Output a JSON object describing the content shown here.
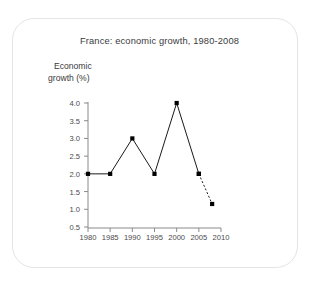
{
  "figure": {
    "card_border_color": "#e4e4e6",
    "background_color": "#ffffff"
  },
  "chart_data": {
    "type": "line",
    "title": "France: economic growth, 1980-2008",
    "xlabel": "Years",
    "ylabel": "Economic growth (%)",
    "ylabel_line1": "Economic",
    "ylabel_line2": "growth (%)",
    "x": [
      1980,
      1985,
      1990,
      1995,
      2000,
      2005,
      2008
    ],
    "values": [
      2.0,
      2.0,
      3.0,
      2.0,
      4.0,
      2.0,
      1.15
    ],
    "series": [
      {
        "name": "Economic growth (%)",
        "x": [
          1980,
          1985,
          1990,
          1995,
          2000,
          2005
        ],
        "values": [
          2.0,
          2.0,
          3.0,
          2.0,
          4.0,
          2.0
        ],
        "style": "solid",
        "marker": "square",
        "color": "#000000"
      },
      {
        "name": "Forecast",
        "x": [
          2005,
          2008
        ],
        "values": [
          2.0,
          1.15
        ],
        "style": "dashed",
        "marker": "square",
        "color": "#000000"
      }
    ],
    "xlim": [
      1980,
      2010
    ],
    "ylim": [
      0.5,
      4.0
    ],
    "xticks": [
      1980,
      1985,
      1990,
      1995,
      2000,
      2005,
      2010
    ],
    "xtick_labels": [
      "1980",
      "1985",
      "1990",
      "1995",
      "2000",
      "2005",
      "2010"
    ],
    "yticks": [
      4.0,
      3.5,
      3.0,
      2.5,
      2.0,
      1.5,
      1.0,
      0.5
    ],
    "ytick_labels": [
      "4.0",
      "3.5",
      "3.0",
      "2.5",
      "2.0",
      "1.5",
      "1.0",
      "0.5"
    ],
    "grid": false,
    "legend": "none",
    "line_color": "#000000",
    "axis_color": "#8a8a8c"
  }
}
